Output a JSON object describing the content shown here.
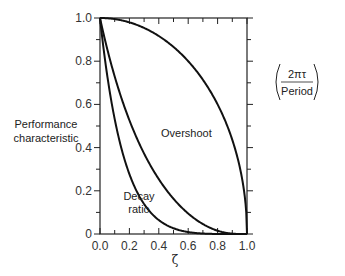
{
  "chart_data": {
    "type": "line",
    "title": "",
    "xlabel": "ζ",
    "ylabel": "Performance characteristic",
    "ylabel_lines": [
      "Performance",
      "characteristic"
    ],
    "xlim": [
      0.0,
      1.0
    ],
    "ylim": [
      0.0,
      1.0
    ],
    "grid": false,
    "legend": "none (curves labeled inline)",
    "x_ticks": [
      "0.0",
      "0.2",
      "0.4",
      "0.6",
      "0.8",
      "1.0"
    ],
    "y_ticks": [
      "0",
      "0.2",
      "0.4",
      "0.6",
      "0.8",
      "1.0"
    ],
    "x": [
      0.0,
      0.1,
      0.2,
      0.3,
      0.4,
      0.5,
      0.6,
      0.7,
      0.8,
      0.9,
      1.0
    ],
    "series": [
      {
        "name": "2πτ/Period",
        "label_lines": [
          "2πτ",
          "Period"
        ],
        "values": [
          1.0,
          0.995,
          0.98,
          0.954,
          0.917,
          0.866,
          0.8,
          0.714,
          0.6,
          0.436,
          0.0
        ]
      },
      {
        "name": "Overshoot",
        "values": [
          1.0,
          0.729,
          0.527,
          0.372,
          0.254,
          0.163,
          0.095,
          0.046,
          0.015,
          0.002,
          0.0
        ]
      },
      {
        "name": "Decay ratio",
        "label_lines": [
          "Decay",
          "ratio"
        ],
        "values": [
          1.0,
          0.532,
          0.278,
          0.138,
          0.064,
          0.027,
          0.009,
          0.002,
          0.0002,
          0.0,
          0.0
        ]
      }
    ]
  },
  "labels": {
    "period_top": "2πτ",
    "period_bottom": "Period",
    "overshoot": "Overshoot",
    "decay_top": "Decay",
    "decay_bottom": "ratio",
    "ylabel_line1": "Performance",
    "ylabel_line2": "characteristic",
    "xlabel": "ζ"
  }
}
